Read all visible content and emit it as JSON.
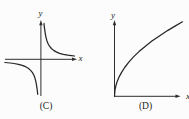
{
  "figure": {
    "panels": [
      {
        "id": "C",
        "caption": "(C)",
        "x_axis_label": "x",
        "y_axis_label": "y"
      },
      {
        "id": "D",
        "caption": "(D)",
        "x_axis_label": "x",
        "y_axis_label": "y"
      }
    ],
    "stroke_color": "#2a2a2a",
    "background_color": "#fcfcfc"
  },
  "chart_data": [
    {
      "type": "line",
      "title": "(C)",
      "xlabel": "x",
      "ylabel": "y",
      "xlim": [
        -4.8,
        4.7
      ],
      "ylim": [
        -5.0,
        5.1
      ],
      "grid": false,
      "legend": false,
      "description": "Reciprocal curve y = 2/x: branches in quadrants I and III approaching both axes asymptotically; arrows on positive x and y axes",
      "series": [
        {
          "name": "branch-quadrant-1",
          "x": [
            0.42,
            0.46,
            0.52,
            0.6,
            0.7,
            0.82,
            0.97,
            1.15,
            1.4,
            1.7,
            2.05,
            2.5,
            3.0,
            3.6,
            4.1,
            4.5
          ],
          "y": [
            4.76,
            4.35,
            3.85,
            3.33,
            2.86,
            2.44,
            2.06,
            1.74,
            1.43,
            1.18,
            0.98,
            0.8,
            0.67,
            0.56,
            0.49,
            0.44
          ]
        },
        {
          "name": "branch-quadrant-3",
          "x": [
            -4.8,
            -4.1,
            -3.6,
            -3.0,
            -2.5,
            -2.05,
            -1.7,
            -1.4,
            -1.15,
            -0.97,
            -0.82,
            -0.7,
            -0.6,
            -0.52,
            -0.46,
            -0.43
          ],
          "y": [
            -0.42,
            -0.49,
            -0.56,
            -0.67,
            -0.8,
            -0.98,
            -1.18,
            -1.43,
            -1.74,
            -2.06,
            -2.44,
            -2.86,
            -3.33,
            -3.85,
            -4.35,
            -4.65
          ]
        }
      ]
    },
    {
      "type": "line",
      "title": "(D)",
      "xlabel": "x",
      "ylabel": "y",
      "xlim": [
        0,
        5.2
      ],
      "ylim": [
        0,
        5.2
      ],
      "grid": false,
      "legend": false,
      "description": "Square-root curve y = 2.28*sqrt(x) starting at the origin, rising steeply then flattening (concave down); arrows on positive x and y axes",
      "series": [
        {
          "name": "sqrt-curve",
          "x": [
            0,
            0.04,
            0.1,
            0.2,
            0.34,
            0.52,
            0.75,
            1.05,
            1.4,
            1.8,
            2.25,
            2.75,
            3.3,
            3.9,
            4.45,
            5.0
          ],
          "y": [
            0,
            0.46,
            0.72,
            1.02,
            1.33,
            1.64,
            1.97,
            2.34,
            2.7,
            3.06,
            3.42,
            3.78,
            4.14,
            4.5,
            4.81,
            5.1
          ]
        }
      ]
    }
  ]
}
